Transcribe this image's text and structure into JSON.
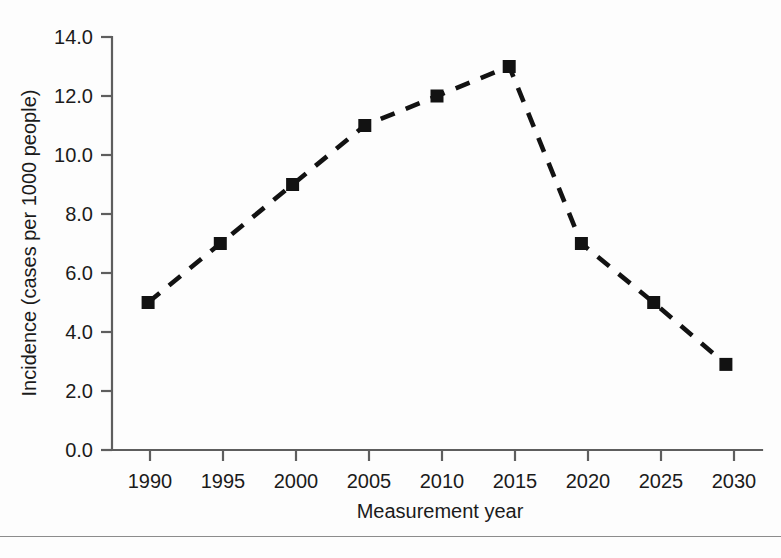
{
  "chart_data": {
    "type": "line",
    "title": "",
    "subtitle": "",
    "xlabel": "Measurement year",
    "ylabel": "Incidence (cases per 1000 people)",
    "x": [
      1990,
      1995,
      2000,
      2005,
      2010,
      2015,
      2020,
      2025,
      2030
    ],
    "categories": [
      "1990",
      "1995",
      "2000",
      "2005",
      "2010",
      "2015",
      "2020",
      "2025",
      "2030"
    ],
    "values": [
      5.0,
      7.0,
      9.0,
      11.0,
      12.0,
      13.0,
      7.0,
      5.0,
      2.9
    ],
    "series": [
      {
        "name": "Incidence",
        "values": [
          5.0,
          7.0,
          9.0,
          11.0,
          12.0,
          13.0,
          7.0,
          5.0,
          2.9
        ],
        "line_style": "dashed",
        "marker": "square",
        "color": "#121212"
      }
    ],
    "xlim": [
      1987.5,
      2032.5
    ],
    "ylim": [
      0.0,
      14.0
    ],
    "xticks": [
      1990,
      1995,
      2000,
      2005,
      2010,
      2015,
      2020,
      2025,
      2030
    ],
    "xticklabels": [
      "1990",
      "1995",
      "2000",
      "2005",
      "2010",
      "2015",
      "2020",
      "2025",
      "2030"
    ],
    "yticks": [
      0.0,
      2.0,
      4.0,
      6.0,
      8.0,
      10.0,
      12.0,
      14.0
    ],
    "yticklabels": [
      "0.0",
      "2.0",
      "4.0",
      "6.0",
      "8.0",
      "10.0",
      "12.0",
      "14.0"
    ],
    "grid": false,
    "legend": false,
    "legend_position": "none",
    "annotations": [],
    "colors": {
      "series": "#121212",
      "axis": "#5e5e5e",
      "text": "#1b1b1b",
      "background": "#fdfdfd"
    }
  }
}
